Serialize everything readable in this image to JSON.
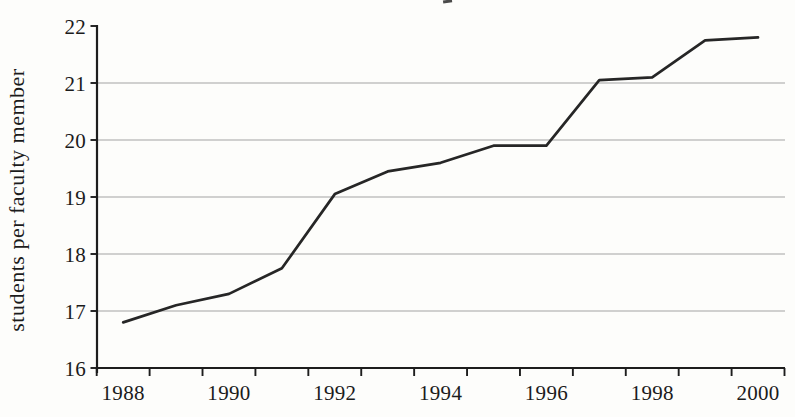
{
  "chart_data": {
    "type": "line",
    "title": "",
    "xlabel": "",
    "ylabel": "students per faculty member",
    "x": [
      1988,
      1989,
      1990,
      1991,
      1992,
      1993,
      1994,
      1995,
      1996,
      1997,
      1998,
      1999,
      2000
    ],
    "series": [
      {
        "name": "students per faculty member",
        "color": "#262626",
        "values": [
          16.8,
          17.1,
          17.3,
          17.75,
          19.05,
          19.45,
          19.6,
          19.9,
          19.9,
          21.05,
          21.1,
          21.75,
          21.8
        ]
      }
    ],
    "ylim": [
      16,
      22
    ],
    "yticks": [
      16,
      17,
      18,
      19,
      20,
      21,
      22
    ],
    "xticks_labeled": [
      "1988",
      "1990",
      "1992",
      "1994",
      "1996",
      "1998",
      "2000"
    ],
    "x_minor_ticks_every_year": true,
    "grid": "horizontal",
    "legend": "none",
    "colors": {
      "line": "#262626",
      "axis": "#1d1d1d",
      "grid": "#a3a3a3",
      "text": "#1b1b1b",
      "background": "#fdfdfb"
    }
  }
}
